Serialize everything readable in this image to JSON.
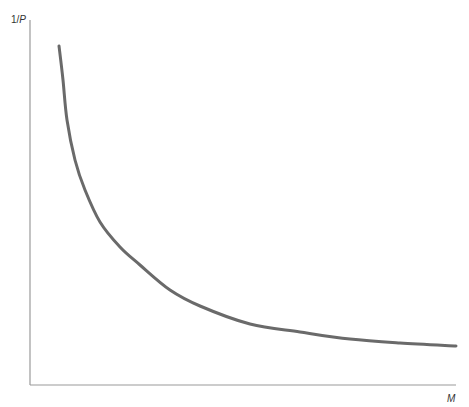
{
  "chart_data": {
    "type": "line",
    "title": "",
    "xlabel": "M",
    "ylabel": "1/P",
    "grid": false,
    "legend": null,
    "series": [
      {
        "name": "curve",
        "color": "#6a6a6a",
        "points_px": [
          [
            59,
            46
          ],
          [
            63,
            80
          ],
          [
            67,
            120
          ],
          [
            75,
            160
          ],
          [
            85,
            190
          ],
          [
            100,
            222
          ],
          [
            120,
            247
          ],
          [
            140,
            265
          ],
          [
            170,
            290
          ],
          [
            200,
            306
          ],
          [
            250,
            324
          ],
          [
            300,
            332
          ],
          [
            350,
            339
          ],
          [
            400,
            343
          ],
          [
            456,
            346
          ]
        ]
      }
    ],
    "axes_px": {
      "origin": [
        30,
        385
      ],
      "y_top": 20,
      "x_right": 456
    }
  },
  "labels": {
    "y_axis_prefix": "1/",
    "y_axis_var": "P",
    "x_axis": "M"
  },
  "colors": {
    "axis": "#9a9a9a",
    "curve": "#6a6a6a",
    "text": "#333333"
  }
}
